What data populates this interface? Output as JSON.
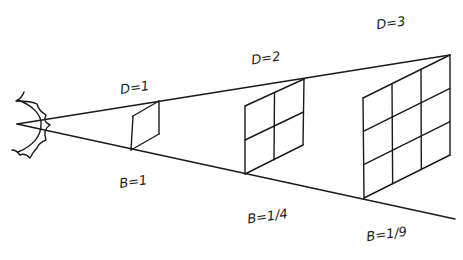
{
  "diagram": {
    "source": {
      "name": "light source",
      "icon": "sun-icon"
    },
    "planes": [
      {
        "distance_label": "D=1",
        "brightness_label": "B=1",
        "grid": 1
      },
      {
        "distance_label": "D=2",
        "brightness_label": "B=1/4",
        "grid": 2
      },
      {
        "distance_label": "D=3",
        "brightness_label": "B=1/9",
        "grid": 3
      }
    ],
    "colors": {
      "ink": "#1a1a1a",
      "background": "#ffffff"
    }
  }
}
